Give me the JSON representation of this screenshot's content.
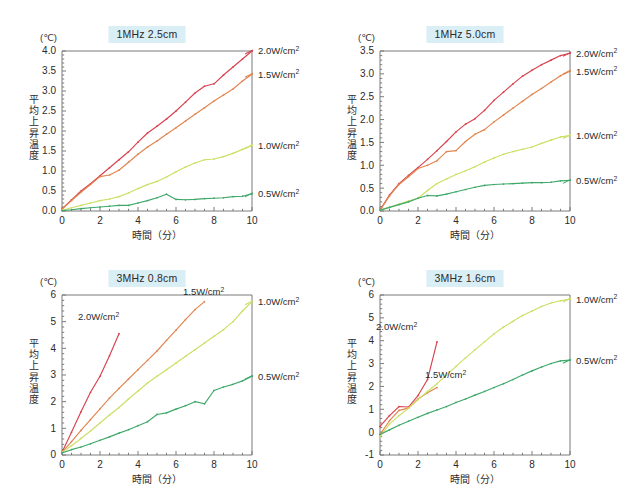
{
  "figure": {
    "unit_label": "(℃)",
    "x_axis_label": "時間（分）",
    "y_axis_label": "平均上昇温度",
    "series_colors": {
      "2.0": "#d8414d",
      "1.5": "#e2854f",
      "1.0": "#ccdf63",
      "0.5": "#3fa86a"
    },
    "title_highlight": "#d9eef5"
  },
  "chart_data": [
    {
      "type": "line",
      "title": "1MHz 2.5cm",
      "xlabel": "時間（分）",
      "ylabel": "平均上昇温度",
      "unit": "(℃)",
      "xlim": [
        0,
        10
      ],
      "ylim": [
        0,
        4.0
      ],
      "xticks": [
        0,
        2,
        4,
        6,
        8,
        10
      ],
      "yticks": [
        "0.0",
        "0.5",
        "1.0",
        "1.5",
        "2.0",
        "2.5",
        "3.0",
        "3.5",
        "4.0"
      ],
      "grid": false,
      "legend_position": "right-outside",
      "x": [
        0,
        0.5,
        1,
        1.5,
        2,
        2.5,
        3,
        3.5,
        4,
        4.5,
        5,
        5.5,
        6,
        6.5,
        7,
        7.5,
        8,
        8.5,
        9,
        9.5,
        10
      ],
      "series": [
        {
          "name": "2.0W/cm2",
          "label": "2.0W/cm",
          "sup": "2",
          "color": "#d8414d",
          "values": [
            0.05,
            0.28,
            0.5,
            0.68,
            0.88,
            1.08,
            1.28,
            1.48,
            1.72,
            1.95,
            2.12,
            2.3,
            2.5,
            2.72,
            2.95,
            3.12,
            3.18,
            3.4,
            3.6,
            3.8,
            4.0
          ]
        },
        {
          "name": "1.5W/cm2",
          "label": "1.5W/cm",
          "sup": "2",
          "color": "#e2854f",
          "values": [
            0.05,
            0.26,
            0.47,
            0.66,
            0.86,
            0.9,
            1.02,
            1.22,
            1.42,
            1.6,
            1.75,
            1.92,
            2.08,
            2.25,
            2.42,
            2.58,
            2.75,
            2.9,
            3.05,
            3.25,
            3.42
          ]
        },
        {
          "name": "1.0W/cm2",
          "label": "1.0W/cm",
          "sup": "2",
          "color": "#ccdf63",
          "values": [
            0.02,
            0.08,
            0.14,
            0.2,
            0.26,
            0.3,
            0.36,
            0.45,
            0.56,
            0.66,
            0.74,
            0.85,
            0.98,
            1.1,
            1.2,
            1.28,
            1.3,
            1.36,
            1.44,
            1.54,
            1.64
          ]
        },
        {
          "name": "0.5W/cm2",
          "label": "0.5W/cm",
          "sup": "2",
          "color": "#3fa86a",
          "values": [
            0.01,
            0.03,
            0.06,
            0.08,
            0.1,
            0.12,
            0.14,
            0.14,
            0.2,
            0.26,
            0.33,
            0.42,
            0.29,
            0.28,
            0.29,
            0.31,
            0.32,
            0.33,
            0.36,
            0.37,
            0.43
          ]
        }
      ]
    },
    {
      "type": "line",
      "title": "1MHz 5.0cm",
      "xlabel": "時間（分）",
      "ylabel": "平均上昇温度",
      "unit": "(℃)",
      "xlim": [
        0,
        10
      ],
      "ylim": [
        0,
        3.5
      ],
      "xticks": [
        0,
        2,
        4,
        6,
        8,
        10
      ],
      "yticks": [
        "0.0",
        "0.5",
        "1.0",
        "1.5",
        "2.0",
        "2.5",
        "3.0",
        "3.5"
      ],
      "grid": false,
      "legend_position": "right-outside",
      "x": [
        0,
        0.5,
        1,
        1.5,
        2,
        2.5,
        3,
        3.5,
        4,
        4.5,
        5,
        5.5,
        6,
        6.5,
        7,
        7.5,
        8,
        8.5,
        9,
        9.5,
        10
      ],
      "series": [
        {
          "name": "2.0W/cm2",
          "label": "2.0W/cm",
          "sup": "2",
          "color": "#d8414d",
          "values": [
            0.02,
            0.35,
            0.6,
            0.78,
            0.95,
            1.13,
            1.32,
            1.52,
            1.73,
            1.9,
            2.02,
            2.2,
            2.42,
            2.6,
            2.78,
            2.95,
            3.08,
            3.2,
            3.3,
            3.4,
            3.45
          ]
        },
        {
          "name": "1.5W/cm2",
          "label": "1.5W/cm",
          "sup": "2",
          "color": "#e2854f",
          "values": [
            0.02,
            0.33,
            0.58,
            0.75,
            0.93,
            1.0,
            1.1,
            1.3,
            1.32,
            1.52,
            1.68,
            1.78,
            1.95,
            2.1,
            2.25,
            2.4,
            2.55,
            2.68,
            2.82,
            2.96,
            3.06
          ]
        },
        {
          "name": "1.0W/cm2",
          "label": "1.0W/cm",
          "sup": "2",
          "color": "#ccdf63",
          "values": [
            0.02,
            0.08,
            0.15,
            0.22,
            0.28,
            0.45,
            0.6,
            0.7,
            0.8,
            0.88,
            0.97,
            1.07,
            1.16,
            1.24,
            1.3,
            1.35,
            1.4,
            1.48,
            1.55,
            1.62,
            1.65
          ]
        },
        {
          "name": "0.5W/cm2",
          "label": "0.5W/cm",
          "sup": "2",
          "color": "#3fa86a",
          "values": [
            0.02,
            0.08,
            0.14,
            0.2,
            0.28,
            0.34,
            0.33,
            0.37,
            0.42,
            0.47,
            0.52,
            0.56,
            0.58,
            0.59,
            0.6,
            0.61,
            0.62,
            0.62,
            0.63,
            0.66,
            0.67
          ]
        }
      ]
    },
    {
      "type": "line",
      "title": "3MHz 0.8cm",
      "xlabel": "時間（分）",
      "ylabel": "平均上昇温度",
      "unit": "(℃)",
      "xlim": [
        0,
        10
      ],
      "ylim": [
        0,
        6
      ],
      "xticks": [
        0,
        2,
        4,
        6,
        8,
        10
      ],
      "yticks": [
        "0",
        "1",
        "2",
        "3",
        "4",
        "5",
        "6"
      ],
      "grid": false,
      "legend_position": "mixed",
      "x": [
        0,
        0.5,
        1,
        1.5,
        2,
        2.5,
        3,
        3.5,
        4,
        4.5,
        5,
        5.5,
        6,
        6.5,
        7,
        7.5,
        8,
        8.5,
        9,
        9.5,
        10
      ],
      "series": [
        {
          "name": "2.0W/cm2",
          "label": "2.0W/cm",
          "sup": "2",
          "color": "#d8414d",
          "inside_label": true,
          "values": [
            0.1,
            0.85,
            1.62,
            2.35,
            2.95,
            3.72,
            4.55
          ]
        },
        {
          "name": "1.5W/cm2",
          "label": "1.5W/cm",
          "sup": "2",
          "color": "#e2854f",
          "inside_label": true,
          "values": [
            0.1,
            0.5,
            0.92,
            1.33,
            1.73,
            2.13,
            2.5,
            2.85,
            3.2,
            3.55,
            3.9,
            4.3,
            4.68,
            5.08,
            5.45,
            5.75
          ]
        },
        {
          "name": "1.0W/cm2",
          "label": "1.0W/cm",
          "sup": "2",
          "color": "#ccdf63",
          "values": [
            0.1,
            0.35,
            0.62,
            0.9,
            1.2,
            1.5,
            1.78,
            2.1,
            2.4,
            2.7,
            2.95,
            3.2,
            3.45,
            3.7,
            3.95,
            4.2,
            4.45,
            4.7,
            5.0,
            5.4,
            5.75
          ]
        },
        {
          "name": "0.5W/cm2",
          "label": "0.5W/cm",
          "sup": "2",
          "color": "#3fa86a",
          "values": [
            0.08,
            0.2,
            0.3,
            0.42,
            0.55,
            0.68,
            0.82,
            0.95,
            1.1,
            1.25,
            1.52,
            1.58,
            1.72,
            1.85,
            2.0,
            1.92,
            2.42,
            2.55,
            2.65,
            2.78,
            2.95
          ]
        }
      ]
    },
    {
      "type": "line",
      "title": "3MHz 1.6cm",
      "xlabel": "時間（分）",
      "ylabel": "平均上昇温度",
      "unit": "(℃)",
      "xlim": [
        0,
        10
      ],
      "ylim": [
        -1,
        6
      ],
      "xticks": [
        0,
        2,
        4,
        6,
        8,
        10
      ],
      "yticks": [
        "-1",
        "0",
        "1",
        "2",
        "3",
        "4",
        "5",
        "6"
      ],
      "grid": false,
      "legend_position": "mixed",
      "x": [
        0,
        0.5,
        1,
        1.5,
        2,
        2.5,
        3,
        3.5,
        4,
        4.5,
        5,
        5.5,
        6,
        6.5,
        7,
        7.5,
        8,
        8.5,
        9,
        9.5,
        10
      ],
      "series": [
        {
          "name": "2.0W/cm2",
          "label": "2.0W/cm",
          "sup": "2",
          "color": "#d8414d",
          "inside_label": true,
          "values": [
            0.25,
            0.72,
            1.12,
            1.1,
            1.6,
            2.3,
            3.95
          ]
        },
        {
          "name": "1.5W/cm2",
          "label": "1.5W/cm",
          "sup": "2",
          "color": "#e2854f",
          "inside_label": true,
          "values": [
            -0.1,
            0.5,
            0.95,
            1.05,
            1.45,
            1.72,
            1.95
          ]
        },
        {
          "name": "1.0W/cm2",
          "label": "1.0W/cm",
          "sup": "2",
          "color": "#ccdf63",
          "values": [
            -0.2,
            0.35,
            0.72,
            1.05,
            1.42,
            1.78,
            2.12,
            2.5,
            2.88,
            3.25,
            3.6,
            3.95,
            4.3,
            4.6,
            4.85,
            5.1,
            5.3,
            5.5,
            5.65,
            5.75,
            5.82
          ]
        },
        {
          "name": "0.5W/cm2",
          "label": "0.5W/cm",
          "sup": "2",
          "color": "#3fa86a",
          "values": [
            -0.1,
            0.1,
            0.3,
            0.48,
            0.65,
            0.82,
            0.97,
            1.12,
            1.3,
            1.45,
            1.62,
            1.78,
            1.95,
            2.12,
            2.3,
            2.5,
            2.68,
            2.85,
            3.0,
            3.12,
            3.15
          ]
        }
      ]
    }
  ]
}
